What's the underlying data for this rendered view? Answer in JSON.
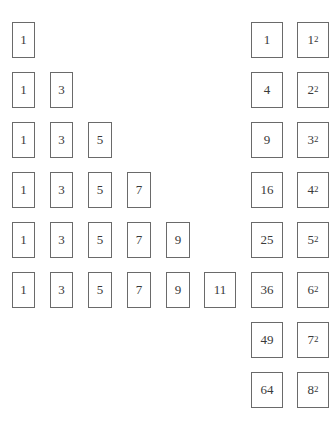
{
  "rows": [
    [
      "1"
    ],
    [
      "1",
      "3"
    ],
    [
      "1",
      "3",
      "5"
    ],
    [
      "1",
      "3",
      "5",
      "7"
    ],
    [
      "1",
      "3",
      "5",
      "7",
      "9"
    ],
    [
      "1",
      "3",
      "5",
      "7",
      "9",
      "11"
    ]
  ],
  "sums": [
    "1",
    "4",
    "9",
    "16",
    "25",
    "36",
    "49",
    "64"
  ],
  "squares": [
    {
      "base": "1",
      "exp": "2"
    },
    {
      "base": "2",
      "exp": "2"
    },
    {
      "base": "3",
      "exp": "2"
    },
    {
      "base": "4",
      "exp": "2"
    },
    {
      "base": "5",
      "exp": "2"
    },
    {
      "base": "6",
      "exp": "2"
    },
    {
      "base": "7",
      "exp": "2"
    },
    {
      "base": "8",
      "exp": "2"
    }
  ]
}
